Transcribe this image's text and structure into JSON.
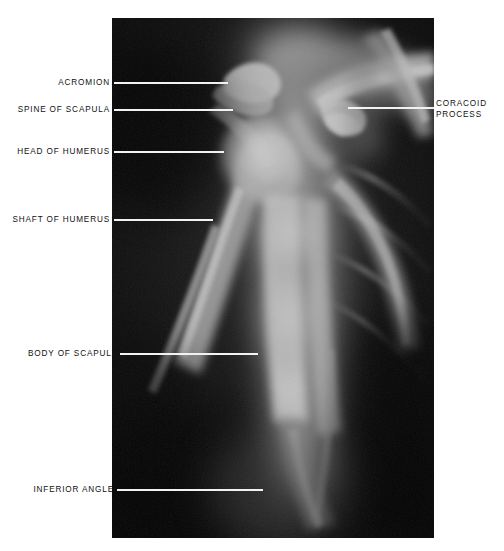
{
  "figure": {
    "kind": "annotated-radiograph",
    "modality": "X-ray",
    "region": "Shoulder girdle (scapula / proximal humerus), anteroposterior projection",
    "background_color": "#ffffff",
    "panel": {
      "x": 112,
      "y": 18,
      "width": 322,
      "height": 520,
      "film_base_color": "#0b0b0b",
      "leader_line_color": "#f2f2f2"
    }
  },
  "labels": [
    {
      "id": "acromion",
      "text": "ACROMION",
      "side": "left",
      "text_right_px": 110,
      "text_baseline_y_px": 83,
      "leader": {
        "x1": 114,
        "x2": 228,
        "y": 83
      }
    },
    {
      "id": "spine-of-scapula",
      "text": "SPINE OF SCAPULA",
      "side": "left",
      "text_right_px": 110,
      "text_baseline_y_px": 110,
      "leader": {
        "x1": 114,
        "x2": 233,
        "y": 110
      }
    },
    {
      "id": "head-of-humerus",
      "text": "HEAD OF HUMERUS",
      "side": "left",
      "text_right_px": 110,
      "text_baseline_y_px": 152,
      "leader": {
        "x1": 114,
        "x2": 224,
        "y": 152
      }
    },
    {
      "id": "shaft-of-humerus",
      "text": "SHAFT OF HUMERUS",
      "side": "left",
      "text_right_px": 110,
      "text_baseline_y_px": 220,
      "leader": {
        "x1": 114,
        "x2": 213,
        "y": 220
      }
    },
    {
      "id": "body-of-scapula",
      "text": "BODY OF SCAPULA",
      "side": "left",
      "text_right_px": 118,
      "text_baseline_y_px": 354,
      "leader": {
        "x1": 120,
        "x2": 258,
        "y": 354
      }
    },
    {
      "id": "inferior-angle",
      "text": "INFERIOR ANGLE",
      "side": "left",
      "text_right_px": 114,
      "text_baseline_y_px": 490,
      "leader": {
        "x1": 117,
        "x2": 263,
        "y": 490
      }
    },
    {
      "id": "coracoid-process",
      "text": "CORACOID",
      "text_line2": "PROCESS",
      "side": "right",
      "text_left_px": 436,
      "text_baseline_y_px": 104,
      "leader": {
        "x1": 348,
        "x2": 434,
        "y": 108
      }
    }
  ]
}
